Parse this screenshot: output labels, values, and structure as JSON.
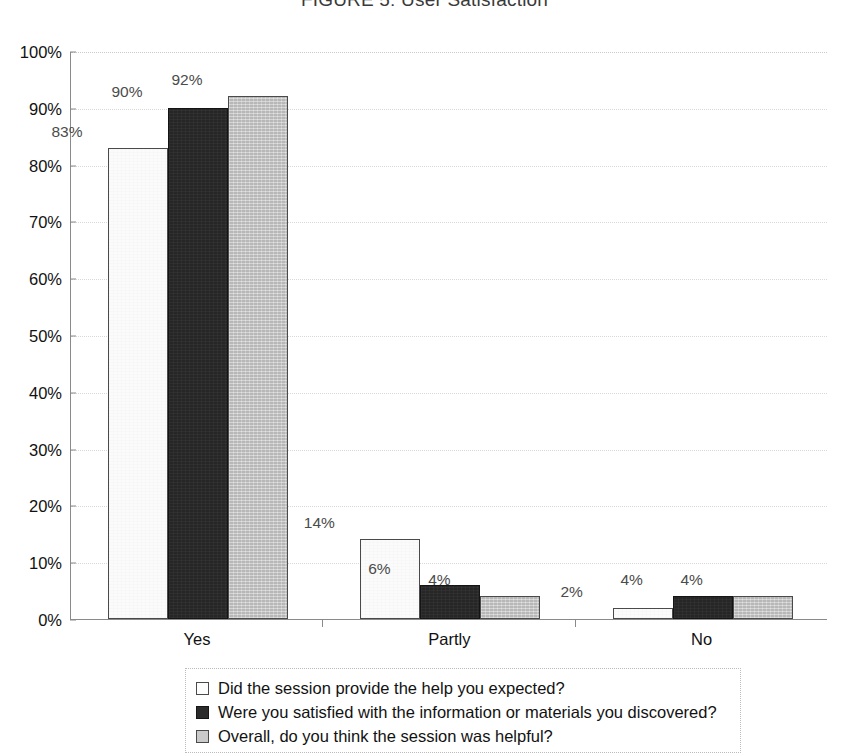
{
  "chart_data": {
    "type": "bar",
    "title": "FIGURE 5: User Satisfaction",
    "xlabel": "",
    "ylabel": "",
    "ylim": [
      0,
      100
    ],
    "ytick_labels": [
      "0%",
      "10%",
      "20%",
      "30%",
      "40%",
      "50%",
      "60%",
      "70%",
      "80%",
      "90%",
      "100%"
    ],
    "ytick_values": [
      0,
      10,
      20,
      30,
      40,
      50,
      60,
      70,
      80,
      90,
      100
    ],
    "grid": true,
    "legend_position": "bottom",
    "categories": [
      "Yes",
      "Partly",
      "No"
    ],
    "series": [
      {
        "name": "Did the session provide the help you expected?",
        "color": "#fbfbfb",
        "values": [
          83,
          14,
          2
        ],
        "labels": [
          "83%",
          "14%",
          "2%"
        ]
      },
      {
        "name": "Were you satisfied with the information or materials you discovered?",
        "color": "#262626",
        "values": [
          90,
          6,
          4
        ],
        "labels": [
          "90%",
          "6%",
          "4%"
        ]
      },
      {
        "name": "Overall, do you think the session was helpful?",
        "color": "#c9c9c9",
        "values": [
          92,
          4,
          4
        ],
        "labels": [
          "92%",
          "4%",
          "4%"
        ]
      }
    ]
  },
  "legend": {
    "items": [
      {
        "label": "Did the session provide the help you expected?",
        "swatch": "legend-swatch-white"
      },
      {
        "label": "Were you satisfied with the information or materials you discovered?",
        "swatch": "legend-swatch-dark"
      },
      {
        "label": "Overall, do you think the session was helpful?",
        "swatch": "legend-swatch-gray"
      }
    ]
  }
}
